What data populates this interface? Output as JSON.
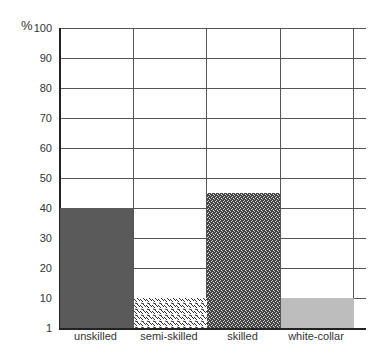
{
  "chart_data": {
    "type": "bar",
    "title": "",
    "ylabel": "%",
    "xlabel": "",
    "categories": [
      "unskilled",
      "semi-skilled",
      "skilled",
      "white-collar"
    ],
    "values": [
      40,
      10,
      45,
      10
    ],
    "ylim": [
      1,
      100
    ],
    "yticks": [
      "1",
      "10",
      "20",
      "30",
      "40",
      "50",
      "60",
      "70",
      "80",
      "90",
      "100"
    ],
    "grid": true,
    "fills": [
      "#5a5a5a",
      "stipple-light",
      "speckle-dark",
      "#bdbdbd"
    ]
  }
}
